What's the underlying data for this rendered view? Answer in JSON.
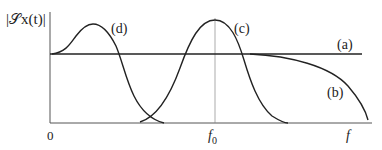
{
  "diagram": {
    "ylabel": "|𝒮x(t)|",
    "xlabel": "f",
    "origin_label": "0",
    "center_tick_label_base": "f",
    "center_tick_label_sub": "0",
    "curves": [
      {
        "id": "a",
        "label": "(a)",
        "description": "flat horizontal line"
      },
      {
        "id": "b",
        "label": "(b)",
        "description": "flat then rolls off at high frequency"
      },
      {
        "id": "c",
        "label": "(c)",
        "description": "bandpass bump centered at f0"
      },
      {
        "id": "d",
        "label": "(d)",
        "description": "lowpass bump near zero frequency"
      }
    ]
  }
}
